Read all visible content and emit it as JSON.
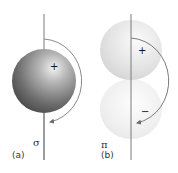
{
  "diagram": {
    "panels": [
      {
        "id": "a",
        "label": "(a)",
        "bond_symbol": "σ",
        "lobes": [
          {
            "sign": "+"
          }
        ]
      },
      {
        "id": "b",
        "label": "(b)",
        "bond_symbol": "π",
        "lobes": [
          {
            "sign": "+"
          },
          {
            "sign": "−"
          }
        ]
      }
    ],
    "colors": {
      "axis": "#7a7a7a",
      "arc": "#8a8a8a",
      "sphere_dark": "#3a3a3a",
      "sphere_light": "#e8e8e8",
      "lobe_upper": "#d9d9d9",
      "lobe_lower": "#ececec"
    }
  }
}
